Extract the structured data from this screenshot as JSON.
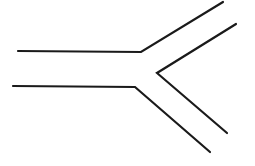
{
  "diagram": {
    "type": "line-drawing",
    "background": "#ffffff",
    "stroke_color": "#1a1a1a",
    "stroke_width": 2.2,
    "paths": [
      {
        "name": "upper-outer-wall",
        "points": [
          [
            18,
            51
          ],
          [
            141,
            52
          ],
          [
            223,
            2
          ]
        ]
      },
      {
        "name": "inner-fork-wall",
        "points": [
          [
            236,
            24
          ],
          [
            157,
            73
          ],
          [
            227,
            133
          ]
        ]
      },
      {
        "name": "lower-outer-wall",
        "points": [
          [
            13,
            86
          ],
          [
            135,
            87
          ],
          [
            210,
            152
          ]
        ]
      }
    ]
  }
}
